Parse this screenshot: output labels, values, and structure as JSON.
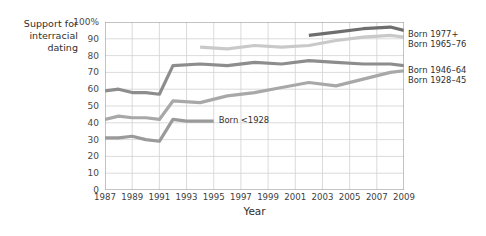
{
  "figure": {
    "y_caption_lines": [
      "Support for",
      "interracial",
      "dating"
    ],
    "x_axis_title": "Year"
  },
  "legend": {
    "entries": [
      {
        "label": "Born 1977+",
        "color": "#6e6e6e"
      },
      {
        "label": "Born 1965–76",
        "color": "#c9c9c9"
      },
      {
        "label": "Born 1946–64",
        "color": "#8d8d8d"
      },
      {
        "label": "Born 1928–45",
        "color": "#a8a8a8"
      }
    ]
  },
  "annotations": [
    {
      "name": "born-before-1928-note",
      "label": "Born <1928",
      "color": "#9a9a9a"
    }
  ],
  "chart_data": {
    "type": "line",
    "title": "",
    "xlabel": "Year",
    "ylabel": "Support for interracial dating",
    "xlim": [
      1987,
      2009
    ],
    "ylim": [
      0,
      100
    ],
    "ytick_labels": [
      "0",
      "10",
      "20",
      "30",
      "40",
      "50",
      "60",
      "70",
      "80",
      "90",
      "100%"
    ],
    "yticks": [
      0,
      10,
      20,
      30,
      40,
      50,
      60,
      70,
      80,
      90,
      100
    ],
    "xticks": [
      1987,
      1989,
      1991,
      1993,
      1995,
      1997,
      1999,
      2001,
      2003,
      2005,
      2007,
      2009
    ],
    "grid": true,
    "legend_position": "right",
    "series": [
      {
        "name": "Born 1977+",
        "color": "#6e6e6e",
        "x": [
          2002,
          2004,
          2006,
          2008,
          2009
        ],
        "values": [
          92,
          94,
          96,
          97,
          95
        ]
      },
      {
        "name": "Born 1965–76",
        "color": "#c9c9c9",
        "x": [
          1994,
          1996,
          1998,
          2000,
          2002,
          2004,
          2006,
          2008,
          2009
        ],
        "values": [
          85,
          84,
          86,
          85,
          86,
          89,
          91,
          92,
          91
        ]
      },
      {
        "name": "Born 1946–64",
        "color": "#8d8d8d",
        "x": [
          1987,
          1988,
          1989,
          1990,
          1991,
          1992,
          1994,
          1996,
          1998,
          2000,
          2002,
          2004,
          2006,
          2008,
          2009
        ],
        "values": [
          59,
          60,
          58,
          58,
          57,
          74,
          75,
          74,
          76,
          75,
          77,
          76,
          75,
          75,
          74
        ],
        "note": "upper dark line"
      },
      {
        "name": "Born 1928–45",
        "color": "#a8a8a8",
        "x": [
          1987,
          1988,
          1989,
          1990,
          1991,
          1992,
          1994,
          1996,
          1998,
          2000,
          2002,
          2004,
          2006,
          2008,
          2009
        ],
        "values": [
          42,
          44,
          43,
          43,
          42,
          53,
          52,
          56,
          58,
          61,
          64,
          62,
          66,
          70,
          71
        ]
      },
      {
        "name": "Born <1928",
        "color": "#9a9a9a",
        "x": [
          1987,
          1988,
          1989,
          1990,
          1991,
          1992,
          1993,
          1994,
          1995
        ],
        "values": [
          31,
          31,
          32,
          30,
          29,
          42,
          41,
          41,
          41
        ]
      }
    ]
  }
}
